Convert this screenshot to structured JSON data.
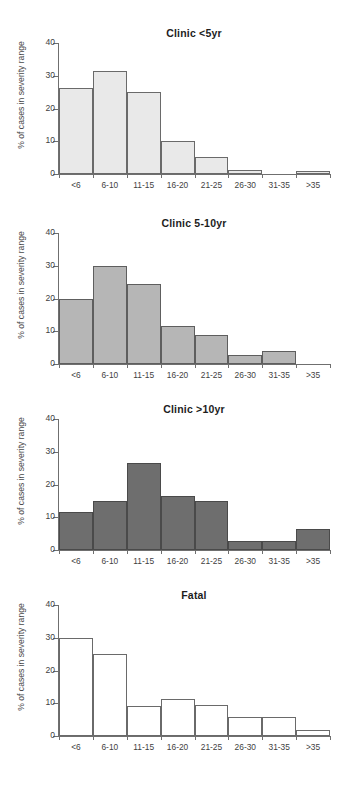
{
  "figure": {
    "ylabel": "% of cases in severity range",
    "ytick_labels": [
      "0",
      "10",
      "20",
      "30",
      "40"
    ],
    "categories": [
      "<6",
      "6-10",
      "11-15",
      "16-20",
      "21-25",
      "26-30",
      "31-35",
      ">35"
    ]
  },
  "chart_data": [
    {
      "type": "bar",
      "title": "Clinic <5yr",
      "xlabel": "",
      "ylabel": "% of cases in severity range",
      "categories": [
        "<6",
        "6-10",
        "11-15",
        "16-20",
        "21-25",
        "26-30",
        "31-35",
        ">35"
      ],
      "values": [
        26.3,
        31.5,
        25.0,
        10.0,
        5.3,
        1.3,
        0.0,
        0.8
      ],
      "ylim": [
        0,
        40
      ],
      "yticks": [
        0,
        10,
        20,
        30,
        40
      ],
      "grid": false,
      "legend": "none",
      "bar_fill": "#e9e9e9",
      "bar_stroke": "#6a6a6a"
    },
    {
      "type": "bar",
      "title": "Clinic 5-10yr",
      "xlabel": "",
      "ylabel": "% of cases in severity range",
      "categories": [
        "<6",
        "6-10",
        "11-15",
        "16-20",
        "21-25",
        "26-30",
        "31-35",
        ">35"
      ],
      "values": [
        19.8,
        29.8,
        24.5,
        11.5,
        9.0,
        2.8,
        4.0,
        0.0
      ],
      "ylim": [
        0,
        40
      ],
      "yticks": [
        0,
        10,
        20,
        30,
        40
      ],
      "grid": false,
      "legend": "none",
      "bar_fill": "#b6b6b6",
      "bar_stroke": "#5e5e5e"
    },
    {
      "type": "bar",
      "title": "Clinic >10yr",
      "xlabel": "",
      "ylabel": "% of cases in severity range",
      "categories": [
        "<6",
        "6-10",
        "11-15",
        "16-20",
        "21-25",
        "26-30",
        "31-35",
        ">35"
      ],
      "values": [
        11.7,
        15.0,
        26.7,
        16.6,
        14.9,
        2.9,
        2.9,
        6.4
      ],
      "ylim": [
        0,
        40
      ],
      "yticks": [
        0,
        10,
        20,
        30,
        40
      ],
      "grid": false,
      "legend": "none",
      "bar_fill": "#6e6e6e",
      "bar_stroke": "#4a4a4a"
    },
    {
      "type": "bar",
      "title": "Fatal",
      "xlabel": "",
      "ylabel": "% of cases in severity range",
      "categories": [
        "<6",
        "6-10",
        "11-15",
        "16-20",
        "21-25",
        "26-30",
        "31-35",
        ">35"
      ],
      "values": [
        30.0,
        25.0,
        9.3,
        11.4,
        9.6,
        5.9,
        5.9,
        1.8
      ],
      "ylim": [
        0,
        40
      ],
      "yticks": [
        0,
        10,
        20,
        30,
        40
      ],
      "grid": false,
      "legend": "none",
      "bar_fill": "#ffffff",
      "bar_stroke": "#6a6a6a"
    }
  ]
}
